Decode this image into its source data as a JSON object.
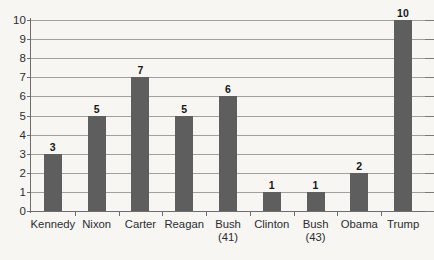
{
  "chart_data": {
    "type": "bar",
    "title": "",
    "subtitle": "",
    "xlabel": "",
    "ylabel": "",
    "categories": [
      "Kennedy",
      "Nixon",
      "Carter",
      "Reagan",
      "Bush (41)",
      "Clinton",
      "Bush (43)",
      "Obama",
      "Trump"
    ],
    "category_lines": [
      [
        "Kennedy"
      ],
      [
        "Nixon"
      ],
      [
        "Carter"
      ],
      [
        "Reagan"
      ],
      [
        "Bush",
        "(41)"
      ],
      [
        "Clinton"
      ],
      [
        "Bush",
        "(43)"
      ],
      [
        "Obama"
      ],
      [
        "Trump"
      ]
    ],
    "values": [
      3,
      5,
      7,
      5,
      6,
      1,
      1,
      2,
      10
    ],
    "data_labels": [
      "3",
      "5",
      "7",
      "5",
      "6",
      "1",
      "1",
      "2",
      "10"
    ],
    "ylim": [
      0,
      10
    ],
    "ytick_labels": [
      "0",
      "1",
      "2",
      "3",
      "4",
      "5",
      "6",
      "7",
      "8",
      "9",
      "10"
    ],
    "ytick_values": [
      0,
      1,
      2,
      3,
      4,
      5,
      6,
      7,
      8,
      9,
      10
    ],
    "grid": true,
    "grid_axis": "y",
    "legend": false,
    "legend_position": "none",
    "bar_color": "#5e5e5e",
    "gridline_color": "#a2a09d",
    "axis_color": "#6d6d6d",
    "label_color": "#2d2d30",
    "background_color": "#f7f6f3"
  }
}
